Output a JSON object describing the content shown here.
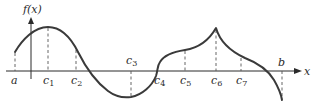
{
  "figure": {
    "type": "function-graph",
    "y_axis_label": "f(x)",
    "x_axis_label": "x",
    "curve_color": "#3a3a3a",
    "axis_color": "#2a2a2a",
    "guide_color": "#555555",
    "points": [
      {
        "name": "a",
        "base": "a",
        "sub": "",
        "x": 15,
        "y": 52,
        "label_y": 84
      },
      {
        "name": "c1",
        "base": "c",
        "sub": "1",
        "x": 48,
        "y": 27,
        "label_y": 84
      },
      {
        "name": "c2",
        "base": "c",
        "sub": "2",
        "x": 76,
        "y": 49,
        "label_y": 84
      },
      {
        "name": "c3",
        "base": "c",
        "sub": "3",
        "x": 131,
        "y": 97,
        "label_y": 63
      },
      {
        "name": "c4",
        "base": "c",
        "sub": "4",
        "x": 158,
        "y": 71,
        "label_y": 84
      },
      {
        "name": "c5",
        "base": "c",
        "sub": "5",
        "x": 185,
        "y": 50,
        "label_y": 84
      },
      {
        "name": "c6",
        "base": "c",
        "sub": "6",
        "x": 216,
        "y": 28,
        "label_y": 84
      },
      {
        "name": "c7",
        "base": "c",
        "sub": "7",
        "x": 241,
        "y": 57,
        "label_y": 84
      },
      {
        "name": "b",
        "base": "b",
        "sub": "",
        "x": 282,
        "y": 99,
        "label_y": 63
      }
    ]
  }
}
